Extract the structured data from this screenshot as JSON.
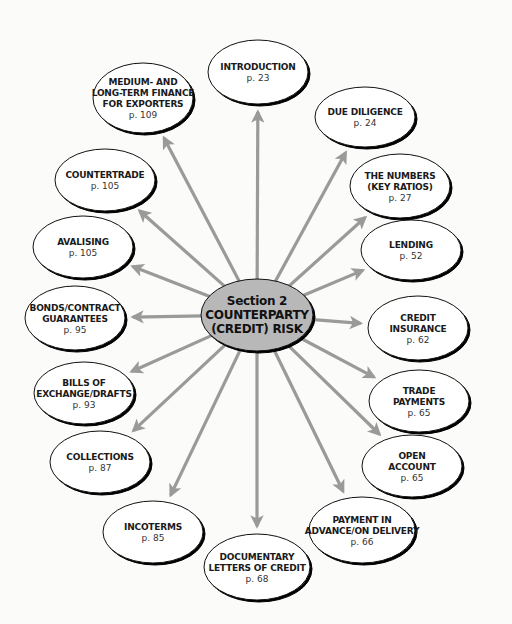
{
  "diagram": {
    "colors": {
      "background": "#fbfbfa",
      "arrow": "#9a9a9a",
      "node_fill": "#ffffff",
      "node_stroke": "#111111",
      "center_fill": "#b8b8b8"
    },
    "center": {
      "lines": [
        "Section 2",
        "COUNTERPARTY",
        "(CREDIT) RISK"
      ],
      "cx": 257,
      "cy": 315,
      "rx": 56,
      "ry": 36
    },
    "nodes": [
      {
        "id": "introduction",
        "lines": [
          "INTRODUCTION"
        ],
        "page": "p. 23",
        "cx": 258,
        "cy": 72,
        "rx": 50,
        "ry": 32
      },
      {
        "id": "due-diligence",
        "lines": [
          "DUE DILIGENCE"
        ],
        "page": "p. 24",
        "cx": 365,
        "cy": 117,
        "rx": 50,
        "ry": 30
      },
      {
        "id": "the-numbers",
        "lines": [
          "THE NUMBERS",
          "(KEY RATIOS)"
        ],
        "page": "p. 27",
        "cx": 400,
        "cy": 186,
        "rx": 50,
        "ry": 32
      },
      {
        "id": "lending",
        "lines": [
          "LENDING"
        ],
        "page": "p. 52",
        "cx": 411,
        "cy": 250,
        "rx": 50,
        "ry": 30
      },
      {
        "id": "credit-insurance",
        "lines": [
          "CREDIT",
          "INSURANCE"
        ],
        "page": "p. 62",
        "cx": 418,
        "cy": 328,
        "rx": 50,
        "ry": 32
      },
      {
        "id": "trade-payments",
        "lines": [
          "TRADE",
          "PAYMENTS"
        ],
        "page": "p. 65",
        "cx": 419,
        "cy": 401,
        "rx": 50,
        "ry": 31
      },
      {
        "id": "open-account",
        "lines": [
          "OPEN",
          "ACCOUNT"
        ],
        "page": "p. 65",
        "cx": 412,
        "cy": 466,
        "rx": 50,
        "ry": 31
      },
      {
        "id": "payment-in-advance",
        "lines": [
          "PAYMENT IN",
          "ADVANCE/ON DELIVERY"
        ],
        "page": "p. 66",
        "cx": 362,
        "cy": 530,
        "rx": 53,
        "ry": 33
      },
      {
        "id": "documentary-letters-of-credit",
        "lines": [
          "DOCUMENTARY",
          "LETTERS OF CREDIT"
        ],
        "page": "p. 68",
        "cx": 257,
        "cy": 567,
        "rx": 53,
        "ry": 33
      },
      {
        "id": "incoterms",
        "lines": [
          "INCOTERMS"
        ],
        "page": "p. 85",
        "cx": 153,
        "cy": 532,
        "rx": 50,
        "ry": 31
      },
      {
        "id": "collections",
        "lines": [
          "COLLECTIONS"
        ],
        "page": "p. 87",
        "cx": 100,
        "cy": 462,
        "rx": 50,
        "ry": 31
      },
      {
        "id": "bills-of-exchange",
        "lines": [
          "BILLS OF",
          "EXCHANGE/DRAFTS"
        ],
        "page": "p. 93",
        "cx": 84,
        "cy": 393,
        "rx": 50,
        "ry": 31
      },
      {
        "id": "bonds-contract-guarantees",
        "lines": [
          "BONDS/CONTRACT",
          "GUARANTEES"
        ],
        "page": "p. 95",
        "cx": 75,
        "cy": 318,
        "rx": 50,
        "ry": 32
      },
      {
        "id": "avalising",
        "lines": [
          "AVALISING"
        ],
        "page": "p. 105",
        "cx": 83,
        "cy": 247,
        "rx": 50,
        "ry": 31
      },
      {
        "id": "countertrade",
        "lines": [
          "COUNTERTRADE"
        ],
        "page": "p. 105",
        "cx": 105,
        "cy": 180,
        "rx": 50,
        "ry": 31
      },
      {
        "id": "medium-long-term-finance",
        "lines": [
          "MEDIUM- AND",
          "LONG-TERM FINANCE",
          "FOR EXPORTERS"
        ],
        "page": "p. 109",
        "cx": 143,
        "cy": 98,
        "rx": 50,
        "ry": 35
      }
    ]
  }
}
